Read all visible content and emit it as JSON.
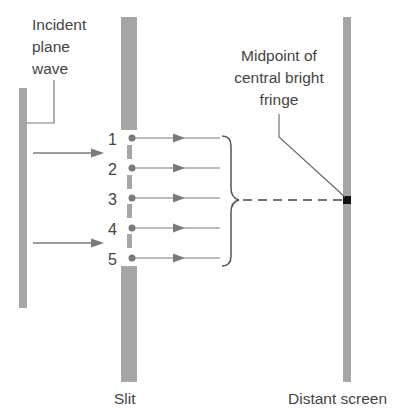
{
  "labels": {
    "incident_line1": "Incident",
    "incident_line2": "plane",
    "incident_line3": "wave",
    "midpoint_line1": "Midpoint of",
    "midpoint_line2": "central bright",
    "midpoint_line3": "fringe",
    "slit": "Slit",
    "screen": "Distant screen"
  },
  "sources": [
    "1",
    "2",
    "3",
    "4",
    "5"
  ],
  "colors": {
    "bar": "#a6a6a6",
    "line": "#7a7a7a",
    "text": "#444444",
    "marker": "#111111"
  }
}
